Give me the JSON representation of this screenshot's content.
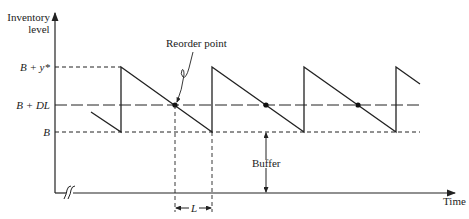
{
  "diagram": {
    "y_axis_label_line1": "Inventory",
    "y_axis_label_line2": "level",
    "x_axis_label": "Time",
    "levels": {
      "top": "B + y*",
      "reorder": "B + DL",
      "buffer_level": "B"
    },
    "annotations": {
      "reorder_point": "Reorder point",
      "buffer": "Buffer",
      "lead_time": "L"
    },
    "colors": {
      "line": "#222222",
      "background": "#ffffff"
    }
  }
}
